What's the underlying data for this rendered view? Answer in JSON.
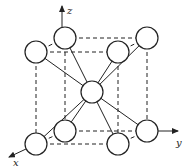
{
  "diagram": {
    "type": "body-centered cubic crystal structure",
    "axes": {
      "x_label": "x",
      "y_label": "y",
      "z_label": "z"
    },
    "colors": {
      "stroke": "#222222",
      "background": "#ffffff",
      "atom_fill": "#ffffff"
    },
    "atoms": [
      {
        "id": "top-back-left",
        "cx": 65,
        "cy": 38
      },
      {
        "id": "top-front-left",
        "cx": 36,
        "cy": 52
      },
      {
        "id": "top-front-right",
        "cx": 118,
        "cy": 52
      },
      {
        "id": "top-back-right",
        "cx": 147,
        "cy": 38
      },
      {
        "id": "center",
        "cx": 92,
        "cy": 92
      },
      {
        "id": "bottom-back-left",
        "cx": 65,
        "cy": 131
      },
      {
        "id": "bottom-front-left",
        "cx": 36,
        "cy": 144
      },
      {
        "id": "bottom-front-right",
        "cx": 118,
        "cy": 144
      },
      {
        "id": "bottom-back-right",
        "cx": 147,
        "cy": 131
      }
    ],
    "atom_radius": 11
  }
}
